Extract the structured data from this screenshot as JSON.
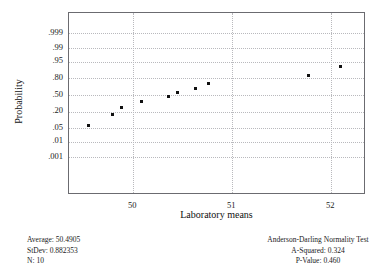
{
  "chart_data": {
    "type": "scatter",
    "title": "",
    "xlabel": "Laboratory means",
    "ylabel": "Probability",
    "xlim": [
      49.35,
      52.35
    ],
    "xticks": [
      50,
      51,
      52
    ],
    "xtick_labels": [
      "50",
      "51",
      "52"
    ],
    "ytick_labels": [
      ".999",
      ".99",
      ".95",
      ".80",
      ".50",
      ".20",
      ".05",
      ".01",
      ".001"
    ],
    "ytick_probabilities": [
      0.999,
      0.99,
      0.95,
      0.8,
      0.5,
      0.2,
      0.05,
      0.01,
      0.001
    ],
    "grid": true,
    "legend": "none",
    "points": [
      {
        "x": 49.55,
        "p": 0.065
      },
      {
        "x": 49.79,
        "p": 0.165
      },
      {
        "x": 49.88,
        "p": 0.265
      },
      {
        "x": 50.08,
        "p": 0.365
      },
      {
        "x": 50.36,
        "p": 0.465
      },
      {
        "x": 50.45,
        "p": 0.545
      },
      {
        "x": 50.63,
        "p": 0.635
      },
      {
        "x": 50.76,
        "p": 0.725
      },
      {
        "x": 51.77,
        "p": 0.835
      },
      {
        "x": 52.09,
        "p": 0.925
      }
    ]
  },
  "axis_titles": {
    "x": "Laboratory means",
    "y": "Probability"
  },
  "stats_left": {
    "average_label": "Average:",
    "average_value": "50.4905",
    "stdev_label": "StDev:",
    "stdev_value": "0.882353",
    "n_label": "N:",
    "n_value": "10",
    "line1": "Average: 50.4905",
    "line2": "StDev: 0.882353",
    "line3": "N: 10"
  },
  "stats_right": {
    "title": "Anderson-Darling Normality Test",
    "a_squared_label": "A-Squared:",
    "a_squared_value": "0.324",
    "p_value_label": "P-Value:",
    "p_value_value": "0.460",
    "line2": "A-Squared: 0.324",
    "line3": "P-Value:   0.460"
  },
  "colors": {
    "frame": "#6b6b70",
    "grid": "#b9b9bd",
    "marker": "#111111",
    "text": "#1a1a1a",
    "background": "#ffffff"
  }
}
